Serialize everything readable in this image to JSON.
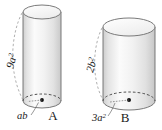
{
  "figure": {
    "background_color": "#ffffff",
    "outline_color": "#595959",
    "body_fill_light": "#fcfcfc",
    "body_fill_mid": "#e6e6e6",
    "body_fill_edge": "#cfcfcf",
    "top_fill": "#f2f2f2",
    "dash_color": "#8c8c8c",
    "text_color": "#1a1a1a",
    "shapes": [
      {
        "name": "cylinder-a",
        "label": "A",
        "height_label_base": "9a",
        "height_label_exponent": "2",
        "radius_label_base": "ab",
        "radius_label_exponent": "",
        "center_x": 42,
        "top_y": 12,
        "bottom_y": 101,
        "radius_x": 19,
        "radius_y": 7
      },
      {
        "name": "cylinder-b",
        "label": "B",
        "height_label_base": "2b",
        "height_label_exponent": "2",
        "radius_label_base": "3a",
        "radius_label_exponent": "2",
        "center_x": 129,
        "top_y": 27,
        "bottom_y": 101,
        "radius_x": 26,
        "radius_y": 9
      }
    ]
  }
}
